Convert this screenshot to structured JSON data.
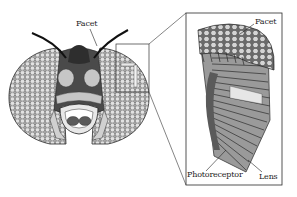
{
  "figure": {
    "labels": {
      "head_facet": "Facet",
      "inset_facet": "Facet",
      "photoreceptor": "Photoreceptor",
      "lens": "Lens"
    },
    "colors": {
      "background": "#ffffff",
      "line": "#2a2a2a",
      "eye_fill": "#b8b8b8",
      "face_dark": "#4a4a4a",
      "face_mid": "#7a7a7a",
      "face_light": "#c6c6c6",
      "facet_light": "#d8d8d8"
    }
  }
}
